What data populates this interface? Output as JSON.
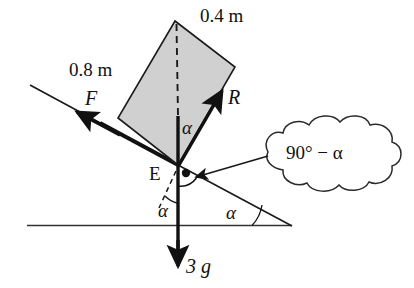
{
  "figure": {
    "background_color": "#ffffff",
    "stroke_color": "#111111",
    "plate_fill_color": "#cccccc"
  },
  "labels": {
    "length_top": "0.4 m",
    "length_side": "0.8 m",
    "force_friction": "F",
    "force_reaction": "R",
    "weight": "3 g",
    "point_E": "E",
    "angle_alpha_plate": "α",
    "angle_alpha_incline": "α",
    "angle_alpha_vertical": "α",
    "callout_text": "90° − α"
  },
  "geometry": {
    "plate_corners": "175,21 235,67 178,165 118,118",
    "incline_start": "30,85",
    "incline_end": "292,226",
    "ground_start": "27,225",
    "ground_end": "292,226",
    "point_E": "178,165",
    "weight_arrow_tip": "178,268",
    "right_angle_dot": "186,173"
  },
  "icons": {
    "arrow_friction": "arrow-left-icon",
    "arrow_reaction": "arrow-up-right-icon",
    "arrow_weight": "arrow-down-icon",
    "arrow_callout": "arrow-pointer-icon",
    "angle_marker": "angle-dot-icon"
  }
}
